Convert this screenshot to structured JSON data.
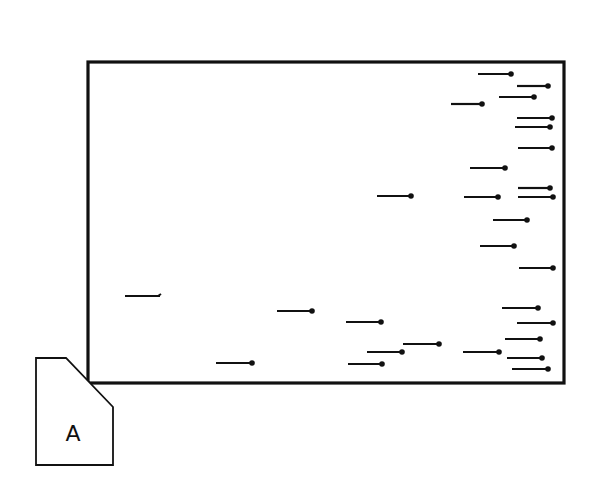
{
  "diagram": {
    "type": "rectangular field with horizontal pin/segment markers and a corner tab",
    "colors": {
      "ink": "#111111",
      "background": "#ffffff"
    },
    "frame": {
      "x1": 88,
      "y1": 62,
      "x2": 564,
      "y2": 383
    },
    "tab": {
      "label": "A",
      "points": [
        [
          36,
          358
        ],
        [
          66,
          358
        ],
        [
          113,
          407
        ],
        [
          113,
          465
        ],
        [
          36,
          465
        ]
      ],
      "label_x": 73,
      "label_y": 441
    },
    "segments": [
      {
        "x1": 478,
        "x2": 511,
        "y": 74,
        "end": "dot"
      },
      {
        "x1": 517,
        "x2": 548,
        "y": 86,
        "end": "dot"
      },
      {
        "x1": 499,
        "x2": 534,
        "y": 97,
        "end": "dot"
      },
      {
        "x1": 451,
        "x2": 482,
        "y": 104,
        "end": "dot"
      },
      {
        "x1": 517,
        "x2": 552,
        "y": 118,
        "end": "dot"
      },
      {
        "x1": 515,
        "x2": 550,
        "y": 127,
        "end": "dot"
      },
      {
        "x1": 518,
        "x2": 552,
        "y": 148,
        "end": "dot"
      },
      {
        "x1": 470,
        "x2": 505,
        "y": 168,
        "end": "dot"
      },
      {
        "x1": 518,
        "x2": 550,
        "y": 188,
        "end": "dot"
      },
      {
        "x1": 377,
        "x2": 411,
        "y": 196,
        "end": "dot"
      },
      {
        "x1": 464,
        "x2": 498,
        "y": 197,
        "end": "dot"
      },
      {
        "x1": 518,
        "x2": 553,
        "y": 197,
        "end": "dot"
      },
      {
        "x1": 493,
        "x2": 527,
        "y": 220,
        "end": "dot"
      },
      {
        "x1": 480,
        "x2": 514,
        "y": 246,
        "end": "dot"
      },
      {
        "x1": 519,
        "x2": 553,
        "y": 268,
        "end": "dot"
      },
      {
        "x1": 125,
        "x2": 160,
        "y": 296,
        "end": "hook"
      },
      {
        "x1": 502,
        "x2": 538,
        "y": 308,
        "end": "dot"
      },
      {
        "x1": 277,
        "x2": 312,
        "y": 311,
        "end": "dot"
      },
      {
        "x1": 346,
        "x2": 381,
        "y": 322,
        "end": "dot"
      },
      {
        "x1": 517,
        "x2": 553,
        "y": 323,
        "end": "dot"
      },
      {
        "x1": 505,
        "x2": 540,
        "y": 339,
        "end": "dot"
      },
      {
        "x1": 403,
        "x2": 439,
        "y": 344,
        "end": "dot"
      },
      {
        "x1": 367,
        "x2": 402,
        "y": 352,
        "end": "dot"
      },
      {
        "x1": 463,
        "x2": 499,
        "y": 352,
        "end": "dot"
      },
      {
        "x1": 507,
        "x2": 542,
        "y": 358,
        "end": "dot"
      },
      {
        "x1": 216,
        "x2": 252,
        "y": 363,
        "end": "dot"
      },
      {
        "x1": 348,
        "x2": 382,
        "y": 364,
        "end": "dot"
      },
      {
        "x1": 512,
        "x2": 548,
        "y": 369,
        "end": "dot"
      }
    ]
  }
}
